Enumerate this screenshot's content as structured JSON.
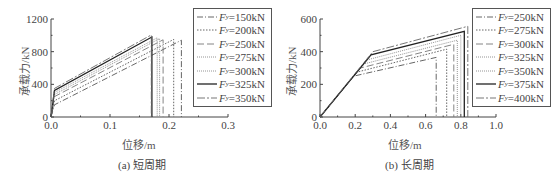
{
  "chart_data": [
    {
      "type": "line",
      "title": "",
      "caption": "(a) 短周期",
      "xlabel": "位移/m",
      "ylabel": "承载力/kN",
      "xlim": [
        0,
        0.3
      ],
      "ylim": [
        0,
        1200
      ],
      "xticks": [
        "0.0",
        "0.1",
        "0.2",
        "0.3"
      ],
      "yticks": [
        "0",
        "400",
        "800",
        "1200"
      ],
      "grid": false,
      "legend_position": "upper right (outside plot)",
      "series": [
        {
          "name": "Fy=150kN",
          "style": "dash-dot",
          "x": [
            0,
            0.006,
            0.221,
            0.221
          ],
          "y": [
            0,
            150,
            940,
            0
          ]
        },
        {
          "name": "Fy=200kN",
          "style": "dotted",
          "x": [
            0,
            0.006,
            0.208,
            0.208
          ],
          "y": [
            0,
            200,
            950,
            0
          ]
        },
        {
          "name": "Fy=250kN",
          "style": "long-dash",
          "x": [
            0,
            0.006,
            0.19,
            0.19
          ],
          "y": [
            0,
            250,
            945,
            0
          ]
        },
        {
          "name": "Fy=275kN",
          "style": "fine-dotted",
          "x": [
            0,
            0.006,
            0.184,
            0.184
          ],
          "y": [
            0,
            275,
            960,
            0
          ]
        },
        {
          "name": "Fy=300kN",
          "style": "fine-dotted",
          "x": [
            0,
            0.006,
            0.18,
            0.18
          ],
          "y": [
            0,
            300,
            970,
            0
          ]
        },
        {
          "name": "Fy=325kN",
          "style": "solid",
          "x": [
            0,
            0.006,
            0.171,
            0.171
          ],
          "y": [
            0,
            325,
            980,
            0
          ]
        },
        {
          "name": "Fy=350kN",
          "style": "dash-dot-long",
          "x": [
            0,
            0.006,
            0.17,
            0.17
          ],
          "y": [
            0,
            350,
            1005,
            0
          ]
        }
      ]
    },
    {
      "type": "line",
      "title": "",
      "caption": "(b) 长周期",
      "xlabel": "位移/m",
      "ylabel": "承载力/kN",
      "xlim": [
        0,
        1.0
      ],
      "ylim": [
        0,
        600
      ],
      "xticks": [
        "0.0",
        "0.2",
        "0.4",
        "0.6",
        "0.8",
        "1.0"
      ],
      "yticks": [
        "0",
        "200",
        "400",
        "600"
      ],
      "grid": false,
      "legend_position": "upper right (outside plot)",
      "series": [
        {
          "name": "Fy=250kN",
          "style": "dash-dot",
          "x": [
            0,
            0.19,
            0.66,
            0.66
          ],
          "y": [
            0,
            250,
            365,
            0
          ]
        },
        {
          "name": "Fy=275kN",
          "style": "dotted",
          "x": [
            0,
            0.21,
            0.72,
            0.72
          ],
          "y": [
            0,
            275,
            415,
            0
          ]
        },
        {
          "name": "Fy=300kN",
          "style": "long-dash",
          "x": [
            0,
            0.23,
            0.76,
            0.76
          ],
          "y": [
            0,
            300,
            445,
            0
          ]
        },
        {
          "name": "Fy=325kN",
          "style": "fine-dotted",
          "x": [
            0,
            0.25,
            0.78,
            0.78
          ],
          "y": [
            0,
            325,
            470,
            0
          ]
        },
        {
          "name": "Fy=350kN",
          "style": "fine-dotted",
          "x": [
            0,
            0.27,
            0.8,
            0.8
          ],
          "y": [
            0,
            350,
            500,
            0
          ]
        },
        {
          "name": "Fy=375kN",
          "style": "solid",
          "x": [
            0,
            0.29,
            0.82,
            0.82
          ],
          "y": [
            0,
            380,
            525,
            0
          ]
        },
        {
          "name": "Fy=400kN",
          "style": "dash-dot-long",
          "x": [
            0,
            0.3,
            0.84,
            0.84
          ],
          "y": [
            0,
            400,
            555,
            0
          ]
        }
      ]
    }
  ],
  "panels": {
    "a": {
      "caption": "(a) 短周期",
      "xlabel": "位移/m",
      "ylabel": "承载力/kN",
      "legend": [
        {
          "sym": "F",
          "sub": "y",
          "value": "=150kN"
        },
        {
          "sym": "F",
          "sub": "y",
          "value": "=200kN"
        },
        {
          "sym": "F",
          "sub": "y",
          "value": "=250kN"
        },
        {
          "sym": "F",
          "sub": "y",
          "value": "=275kN"
        },
        {
          "sym": "F",
          "sub": "y",
          "value": "=300kN"
        },
        {
          "sym": "F",
          "sub": "y",
          "value": "=325kN"
        },
        {
          "sym": "F",
          "sub": "y",
          "value": "=350kN"
        }
      ]
    },
    "b": {
      "caption": "(b) 长周期",
      "xlabel": "位移/m",
      "ylabel": "承载力/kN",
      "legend": [
        {
          "sym": "F",
          "sub": "y",
          "value": "=250kN"
        },
        {
          "sym": "F",
          "sub": "y",
          "value": "=275kN"
        },
        {
          "sym": "F",
          "sub": "y",
          "value": "=300kN"
        },
        {
          "sym": "F",
          "sub": "y",
          "value": "=325kN"
        },
        {
          "sym": "F",
          "sub": "y",
          "value": "=350kN"
        },
        {
          "sym": "F",
          "sub": "y",
          "value": "=375kN"
        },
        {
          "sym": "F",
          "sub": "y",
          "value": "=400kN"
        }
      ]
    }
  }
}
